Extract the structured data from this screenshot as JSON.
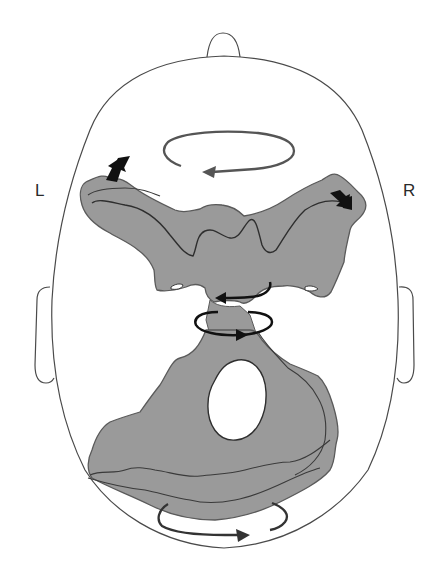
{
  "diagram": {
    "view": "superior view of head with skull base",
    "labels": {
      "left": "L",
      "right": "R"
    },
    "colors": {
      "background": "#ffffff",
      "outline": "#4a4a4a",
      "bone_fill": "#9a9a9a",
      "bone_edge": "#5a5a5a",
      "dark_line": "#2e2e2e",
      "rotation_arrow_gray": "#555555",
      "rotation_arrow_black": "#111111",
      "block_arrow": "#111111"
    },
    "elements": [
      {
        "id": "head-outline",
        "type": "outline"
      },
      {
        "id": "nose",
        "type": "outline"
      },
      {
        "id": "left-ear",
        "type": "outline"
      },
      {
        "id": "right-ear",
        "type": "outline"
      },
      {
        "id": "upper-bone",
        "type": "shape",
        "description": "sphenoid / anterior skull base (butterfly shape)"
      },
      {
        "id": "lower-bone",
        "type": "shape",
        "description": "occipital / posterior skull base with foramen magnum"
      },
      {
        "id": "foramen",
        "type": "hole"
      },
      {
        "id": "top-rotation-arrow",
        "type": "arrow",
        "direction": "counter-clockwise (pointing left)"
      },
      {
        "id": "middle-rotation-arrow-upper",
        "type": "arrow",
        "direction": "pointing left"
      },
      {
        "id": "middle-rotation-arrow-lower",
        "type": "arrow",
        "direction": "pointing right"
      },
      {
        "id": "bottom-rotation-arrow",
        "type": "arrow",
        "direction": "pointing right"
      },
      {
        "id": "left-block-arrow",
        "type": "arrow",
        "direction": "up-right"
      },
      {
        "id": "right-block-arrow",
        "type": "arrow",
        "direction": "down-right"
      }
    ]
  }
}
